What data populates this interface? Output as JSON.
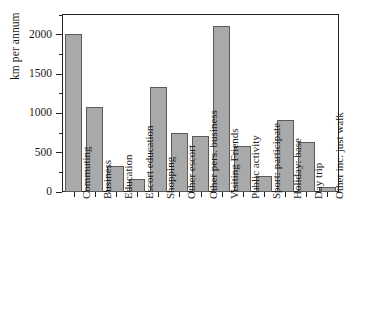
{
  "chart_data": {
    "type": "bar",
    "title": "",
    "xlabel": "",
    "ylabel": "km per annum",
    "ylim": [
      0,
      2250
    ],
    "grid": false,
    "legend": false,
    "y_ticks": [
      0,
      500,
      1000,
      1500,
      2000
    ],
    "y_tick_labels": [
      "0",
      "500",
      "1000",
      "1500",
      "2000"
    ],
    "y_minor_ticks": [
      250,
      750,
      1250,
      1750,
      2250
    ],
    "bar_fill_color": "#a9a9a9",
    "bar_edge_color": "#5a5a5a",
    "axis_color": "#222222",
    "categories": [
      "Commuting",
      "Business",
      "Education",
      "Escort education",
      "Shopping",
      "Other escort",
      "Other pers. business",
      "Visiting Friends",
      "Public activity",
      "Sport: participate",
      "Holiday: base",
      "Day trip",
      "Other inc. just walk"
    ],
    "values": [
      2015,
      1080,
      330,
      160,
      1330,
      750,
      710,
      2115,
      590,
      200,
      910,
      630,
      70
    ]
  }
}
